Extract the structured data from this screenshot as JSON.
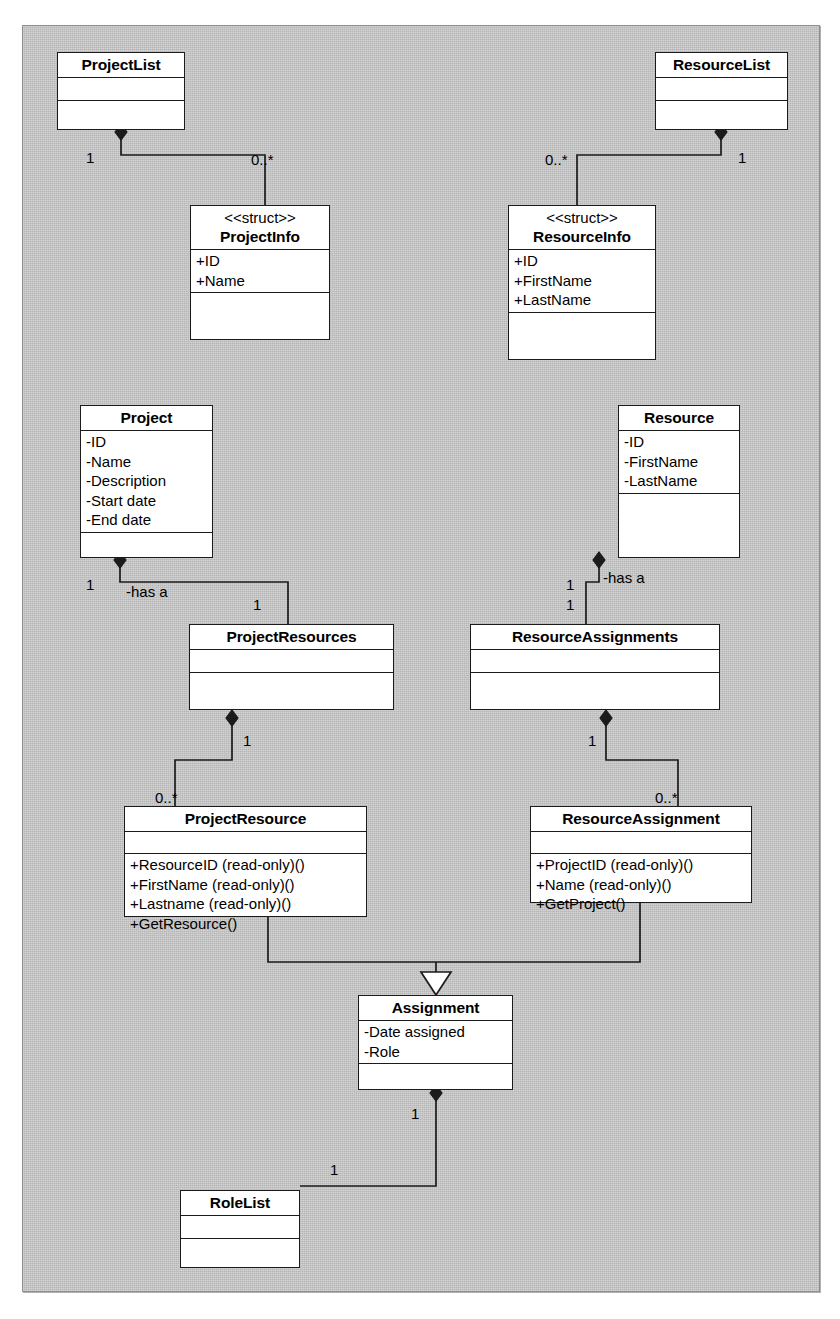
{
  "diagram": {
    "type": "uml-class-diagram",
    "background_color": "#c9c9c9",
    "box_color": "#ffffff",
    "line_color": "#1b1b1b"
  },
  "classes": {
    "project_list": {
      "name": "ProjectList",
      "stereotype": "",
      "attributes": [],
      "operations": []
    },
    "resource_list": {
      "name": "ResourceList",
      "stereotype": "",
      "attributes": [],
      "operations": []
    },
    "project_info": {
      "name": "ProjectInfo",
      "stereotype": "<<struct>>",
      "attributes": [
        "+ID",
        "+Name"
      ],
      "operations": []
    },
    "resource_info": {
      "name": "ResourceInfo",
      "stereotype": "<<struct>>",
      "attributes": [
        "+ID",
        "+FirstName",
        "+LastName"
      ],
      "operations": []
    },
    "project": {
      "name": "Project",
      "stereotype": "",
      "attributes": [
        "-ID",
        "-Name",
        "-Description",
        "-Start date",
        "-End date"
      ],
      "operations": []
    },
    "resource": {
      "name": "Resource",
      "stereotype": "",
      "attributes": [
        "-ID",
        "-FirstName",
        "-LastName"
      ],
      "operations": []
    },
    "project_resources": {
      "name": "ProjectResources",
      "stereotype": "",
      "attributes": [],
      "operations": []
    },
    "resource_assignments": {
      "name": "ResourceAssignments",
      "stereotype": "",
      "attributes": [],
      "operations": []
    },
    "project_resource": {
      "name": "ProjectResource",
      "stereotype": "",
      "attributes": [],
      "operations": [
        "+ResourceID (read-only)()",
        "+FirstName (read-only)()",
        "+Lastname (read-only)()",
        "+GetResource()"
      ]
    },
    "resource_assignment": {
      "name": "ResourceAssignment",
      "stereotype": "",
      "attributes": [],
      "operations": [
        "+ProjectID (read-only)()",
        "+Name (read-only)()",
        "+GetProject()"
      ]
    },
    "assignment": {
      "name": "Assignment",
      "stereotype": "",
      "attributes": [
        "-Date assigned",
        "-Role"
      ],
      "operations": []
    },
    "role_list": {
      "name": "RoleList",
      "stereotype": "",
      "attributes": [],
      "operations": []
    }
  },
  "relationships": [
    {
      "id": "r1",
      "kind": "composition",
      "from": "ProjectList",
      "to": "ProjectInfo",
      "from_multiplicity": "1",
      "to_multiplicity": "0..*",
      "label": ""
    },
    {
      "id": "r2",
      "kind": "composition",
      "from": "ResourceList",
      "to": "ResourceInfo",
      "from_multiplicity": "1",
      "to_multiplicity": "0..*",
      "label": ""
    },
    {
      "id": "r3",
      "kind": "composition",
      "from": "Project",
      "to": "ProjectResources",
      "from_multiplicity": "1",
      "to_multiplicity": "1",
      "label": "-has a"
    },
    {
      "id": "r4",
      "kind": "composition",
      "from": "Resource",
      "to": "ResourceAssignments",
      "from_multiplicity": "1",
      "to_multiplicity": "1",
      "label": "-has a"
    },
    {
      "id": "r5",
      "kind": "composition",
      "from": "ProjectResources",
      "to": "ProjectResource",
      "from_multiplicity": "1",
      "to_multiplicity": "0..*",
      "label": ""
    },
    {
      "id": "r6",
      "kind": "composition",
      "from": "ResourceAssignments",
      "to": "ResourceAssignment",
      "from_multiplicity": "1",
      "to_multiplicity": "0..*",
      "label": ""
    },
    {
      "id": "r7",
      "kind": "generalization",
      "from": "ProjectResource",
      "to": "Assignment",
      "from_multiplicity": "",
      "to_multiplicity": "",
      "label": ""
    },
    {
      "id": "r8",
      "kind": "generalization",
      "from": "ResourceAssignment",
      "to": "Assignment",
      "from_multiplicity": "",
      "to_multiplicity": "",
      "label": ""
    },
    {
      "id": "r9",
      "kind": "composition",
      "from": "Assignment",
      "to": "RoleList",
      "from_multiplicity": "1",
      "to_multiplicity": "1",
      "label": ""
    }
  ],
  "multiplicity_labels": [
    {
      "name": "projectlist-end",
      "text": "1",
      "x": 86,
      "y": 150
    },
    {
      "name": "projectinfo-end",
      "text": "0..*",
      "x": 251,
      "y": 152
    },
    {
      "name": "resourceinfo-end",
      "text": "0..*",
      "x": 545,
      "y": 152
    },
    {
      "name": "resourcelist-end",
      "text": "1",
      "x": 738,
      "y": 150
    },
    {
      "name": "project-end",
      "text": "1",
      "x": 86,
      "y": 577
    },
    {
      "name": "projectresources-top-end",
      "text": "1",
      "x": 253,
      "y": 597
    },
    {
      "name": "resource-end",
      "text": "1",
      "x": 566,
      "y": 577
    },
    {
      "name": "resourceassignments-top",
      "text": "1",
      "x": 566,
      "y": 597
    },
    {
      "name": "projectresources-bot-end",
      "text": "1",
      "x": 243,
      "y": 733
    },
    {
      "name": "projectresource-end",
      "text": "0..*",
      "x": 155,
      "y": 790
    },
    {
      "name": "resourceassignments-bot",
      "text": "1",
      "x": 588,
      "y": 733
    },
    {
      "name": "resourceassignment-end",
      "text": "0..*",
      "x": 655,
      "y": 790
    },
    {
      "name": "assignment-end",
      "text": "1",
      "x": 411,
      "y": 1106
    },
    {
      "name": "rolelist-end",
      "text": "1",
      "x": 330,
      "y": 1162
    }
  ],
  "association_labels": [
    {
      "name": "project-has-a",
      "text": "-has a",
      "x": 126,
      "y": 584
    },
    {
      "name": "resource-has-a",
      "text": "-has a",
      "x": 603,
      "y": 570
    }
  ]
}
